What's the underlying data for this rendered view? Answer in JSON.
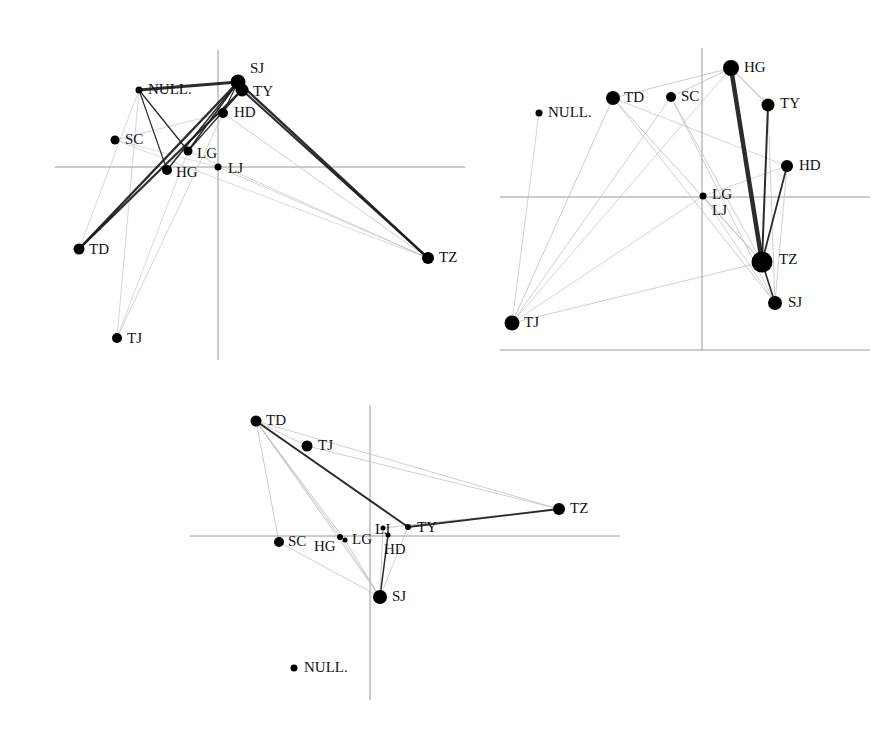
{
  "figure": {
    "title": "",
    "width": 893,
    "height": 729,
    "background": "#ffffff",
    "node_color": "#000000",
    "axis_color": "#9a9a9a",
    "edge_color_strong": "#1a1a1a",
    "edge_color_weak": "#b9b9b9",
    "panel_count": 3
  },
  "chart_data": {
    "type": "scatter",
    "title": "",
    "xlabel": "",
    "ylabel": "",
    "grid": false,
    "legend": "none",
    "labels": [
      "SJ",
      "TY",
      "HD",
      "LG",
      "LJ",
      "HG",
      "SC",
      "NULL.",
      "TD",
      "TJ",
      "TZ"
    ],
    "panels": [
      {
        "id": "panel-top-left",
        "name": "Panel 1",
        "origin": {
          "x": 218,
          "y": 167
        },
        "axes": {
          "horizontal": {
            "y": 167,
            "x1": 55,
            "x2": 465
          },
          "vertical": {
            "x": 218,
            "y1": 50,
            "y2": 360
          }
        },
        "nodes": [
          {
            "label": "SJ",
            "x": 238,
            "y": 82,
            "r": 7.5,
            "lx": 250,
            "ly": 70
          },
          {
            "label": "TY",
            "x": 242,
            "y": 90,
            "r": 6.5,
            "lx": 253,
            "ly": 93
          },
          {
            "label": "HD",
            "x": 223,
            "y": 113,
            "r": 5.0,
            "lx": 234,
            "ly": 114
          },
          {
            "label": "NULL.",
            "x": 139,
            "y": 90,
            "r": 3.5,
            "lx": 148,
            "ly": 91
          },
          {
            "label": "SC",
            "x": 115,
            "y": 140,
            "r": 4.5,
            "lx": 125,
            "ly": 141
          },
          {
            "label": "LG",
            "x": 188,
            "y": 151,
            "r": 4.5,
            "lx": 197,
            "ly": 155
          },
          {
            "label": "HG",
            "x": 167,
            "y": 170,
            "r": 5.0,
            "lx": 176,
            "ly": 174
          },
          {
            "label": "LJ",
            "x": 218,
            "y": 167,
            "r": 3.5,
            "lx": 228,
            "ly": 170
          },
          {
            "label": "TD",
            "x": 79,
            "y": 249,
            "r": 5.5,
            "lx": 89,
            "ly": 251
          },
          {
            "label": "TJ",
            "x": 117,
            "y": 338,
            "r": 5.0,
            "lx": 127,
            "ly": 340
          },
          {
            "label": "TZ",
            "x": 428,
            "y": 258,
            "r": 6.0,
            "lx": 439,
            "ly": 259
          }
        ],
        "edges": [
          {
            "from": "SJ",
            "to": "TY",
            "weight": 4.0,
            "tone": "strong"
          },
          {
            "from": "SJ",
            "to": "TD",
            "weight": 2.4,
            "tone": "strong"
          },
          {
            "from": "TY",
            "to": "TD",
            "weight": 2.2,
            "tone": "strong"
          },
          {
            "from": "SJ",
            "to": "TZ",
            "weight": 2.3,
            "tone": "strong"
          },
          {
            "from": "TY",
            "to": "TZ",
            "weight": 2.0,
            "tone": "strong"
          },
          {
            "from": "SJ",
            "to": "LG",
            "weight": 1.6,
            "tone": "strong"
          },
          {
            "from": "TY",
            "to": "LG",
            "weight": 1.3,
            "tone": "strong"
          },
          {
            "from": "SJ",
            "to": "HG",
            "weight": 1.5,
            "tone": "strong"
          },
          {
            "from": "SJ",
            "to": "NULL.",
            "weight": 3.0,
            "tone": "strong"
          },
          {
            "from": "NULL.",
            "to": "LG",
            "weight": 1.3,
            "tone": "strong"
          },
          {
            "from": "NULL.",
            "to": "HG",
            "weight": 1.2,
            "tone": "strong"
          },
          {
            "from": "SJ",
            "to": "HD",
            "weight": 1.1,
            "tone": "strong"
          },
          {
            "from": "HD",
            "to": "TZ",
            "weight": 0.9,
            "tone": "weak"
          },
          {
            "from": "HD",
            "to": "SC",
            "weight": 0.8,
            "tone": "weak"
          },
          {
            "from": "LG",
            "to": "TZ",
            "weight": 0.8,
            "tone": "weak"
          },
          {
            "from": "LJ",
            "to": "TZ",
            "weight": 0.8,
            "tone": "weak"
          },
          {
            "from": "NULL.",
            "to": "TJ",
            "weight": 0.8,
            "tone": "weak"
          },
          {
            "from": "SJ",
            "to": "TJ",
            "weight": 0.8,
            "tone": "weak"
          },
          {
            "from": "LG",
            "to": "TJ",
            "weight": 0.7,
            "tone": "weak"
          },
          {
            "from": "SC",
            "to": "TZ",
            "weight": 0.7,
            "tone": "weak"
          },
          {
            "from": "NULL.",
            "to": "TD",
            "weight": 0.7,
            "tone": "weak"
          },
          {
            "from": "SC",
            "to": "LJ",
            "weight": 0.7,
            "tone": "weak"
          }
        ]
      },
      {
        "id": "panel-top-right",
        "name": "Panel 2",
        "origin": {
          "x": 702,
          "y": 197
        },
        "axes": {
          "horizontal": {
            "y": 197,
            "x1": 500,
            "x2": 870
          },
          "vertical": {
            "x": 702,
            "y1": 48,
            "y2": 350
          },
          "baseline": {
            "y": 350,
            "x1": 500,
            "x2": 870
          }
        },
        "nodes": [
          {
            "label": "HG",
            "x": 731,
            "y": 68,
            "r": 8.0,
            "lx": 744,
            "ly": 69
          },
          {
            "label": "TD",
            "x": 613,
            "y": 98,
            "r": 7.0,
            "lx": 624,
            "ly": 99
          },
          {
            "label": "SC",
            "x": 671,
            "y": 97,
            "r": 5.0,
            "lx": 681,
            "ly": 98
          },
          {
            "label": "TY",
            "x": 768,
            "y": 105,
            "r": 6.5,
            "lx": 780,
            "ly": 105
          },
          {
            "label": "NULL.",
            "x": 539,
            "y": 113,
            "r": 3.5,
            "lx": 548,
            "ly": 114
          },
          {
            "label": "HD",
            "x": 787,
            "y": 166,
            "r": 6.0,
            "lx": 799,
            "ly": 167
          },
          {
            "label": "LG",
            "x": 703,
            "y": 196,
            "r": 3.5,
            "lx": 712,
            "ly": 196
          },
          {
            "label": "LJ",
            "x": 703,
            "y": 196,
            "r": 2.5,
            "lx": 712,
            "ly": 212
          },
          {
            "label": "TZ",
            "x": 762,
            "y": 262,
            "r": 10.5,
            "lx": 779,
            "ly": 261
          },
          {
            "label": "SJ",
            "x": 775,
            "y": 303,
            "r": 7.0,
            "lx": 788,
            "ly": 304
          },
          {
            "label": "TJ",
            "x": 512,
            "y": 323,
            "r": 7.5,
            "lx": 524,
            "ly": 324
          }
        ],
        "edges": [
          {
            "from": "HG",
            "to": "TZ",
            "weight": 4.5,
            "tone": "strong"
          },
          {
            "from": "TY",
            "to": "TZ",
            "weight": 2.0,
            "tone": "strong"
          },
          {
            "from": "HD",
            "to": "TZ",
            "weight": 1.8,
            "tone": "strong"
          },
          {
            "from": "TZ",
            "to": "SJ",
            "weight": 1.6,
            "tone": "strong"
          },
          {
            "from": "HG",
            "to": "TY",
            "weight": 1.3,
            "tone": "weak"
          },
          {
            "from": "HG",
            "to": "SC",
            "weight": 1.0,
            "tone": "weak"
          },
          {
            "from": "HG",
            "to": "TD",
            "weight": 1.0,
            "tone": "weak"
          },
          {
            "from": "TD",
            "to": "TZ",
            "weight": 1.0,
            "tone": "weak"
          },
          {
            "from": "TD",
            "to": "TJ",
            "weight": 1.0,
            "tone": "weak"
          },
          {
            "from": "TD",
            "to": "SJ",
            "weight": 0.9,
            "tone": "weak"
          },
          {
            "from": "SC",
            "to": "TJ",
            "weight": 0.9,
            "tone": "weak"
          },
          {
            "from": "SC",
            "to": "SJ",
            "weight": 0.9,
            "tone": "weak"
          },
          {
            "from": "SC",
            "to": "TZ",
            "weight": 0.9,
            "tone": "weak"
          },
          {
            "from": "TY",
            "to": "SJ",
            "weight": 0.9,
            "tone": "weak"
          },
          {
            "from": "HD",
            "to": "SJ",
            "weight": 0.9,
            "tone": "weak"
          },
          {
            "from": "HD",
            "to": "LG",
            "weight": 0.8,
            "tone": "weak"
          },
          {
            "from": "LG",
            "to": "TZ",
            "weight": 0.9,
            "tone": "weak"
          },
          {
            "from": "LG",
            "to": "SJ",
            "weight": 0.8,
            "tone": "weak"
          },
          {
            "from": "LG",
            "to": "TJ",
            "weight": 0.8,
            "tone": "weak"
          },
          {
            "from": "NULL.",
            "to": "TJ",
            "weight": 0.8,
            "tone": "weak"
          },
          {
            "from": "TJ",
            "to": "TZ",
            "weight": 0.9,
            "tone": "weak"
          },
          {
            "from": "TD",
            "to": "HD",
            "weight": 0.8,
            "tone": "weak"
          },
          {
            "from": "HG",
            "to": "TJ",
            "weight": 0.8,
            "tone": "weak"
          }
        ]
      },
      {
        "id": "panel-bottom",
        "name": "Panel 3",
        "origin": {
          "x": 370,
          "y": 536
        },
        "axes": {
          "horizontal": {
            "y": 536,
            "x1": 190,
            "x2": 620
          },
          "vertical": {
            "x": 370,
            "y1": 405,
            "y2": 700
          }
        },
        "nodes": [
          {
            "label": "TD",
            "x": 256,
            "y": 421,
            "r": 5.5,
            "lx": 266,
            "ly": 422
          },
          {
            "label": "TJ",
            "x": 307,
            "y": 446,
            "r": 5.5,
            "lx": 318,
            "ly": 447
          },
          {
            "label": "TZ",
            "x": 559,
            "y": 509,
            "r": 6.0,
            "lx": 570,
            "ly": 510
          },
          {
            "label": "SC",
            "x": 279,
            "y": 542,
            "r": 5.0,
            "lx": 288,
            "ly": 543
          },
          {
            "label": "HG",
            "x": 340,
            "y": 537,
            "r": 3.0,
            "lx": 314,
            "ly": 548
          },
          {
            "label": "LG",
            "x": 345,
            "y": 540,
            "r": 2.5,
            "lx": 352,
            "ly": 541
          },
          {
            "label": "LJ",
            "x": 383,
            "y": 528,
            "r": 2.5,
            "lx": 375,
            "ly": 531
          },
          {
            "label": "TY",
            "x": 408,
            "y": 527,
            "r": 3.0,
            "lx": 417,
            "ly": 529
          },
          {
            "label": "HD",
            "x": 388,
            "y": 535,
            "r": 2.5,
            "lx": 384,
            "ly": 551
          },
          {
            "label": "SJ",
            "x": 380,
            "y": 597,
            "r": 7.0,
            "lx": 392,
            "ly": 598
          },
          {
            "label": "NULL.",
            "x": 294,
            "y": 668,
            "r": 3.5,
            "lx": 304,
            "ly": 669
          }
        ],
        "edges": [
          {
            "from": "TD",
            "to": "TY",
            "weight": 2.0,
            "tone": "strong"
          },
          {
            "from": "TY",
            "to": "TZ",
            "weight": 1.8,
            "tone": "strong"
          },
          {
            "from": "LJ",
            "to": "TZ",
            "weight": 1.2,
            "tone": "weak"
          },
          {
            "from": "HD",
            "to": "SJ",
            "weight": 1.5,
            "tone": "strong"
          },
          {
            "from": "TD",
            "to": "SC",
            "weight": 1.0,
            "tone": "weak"
          },
          {
            "from": "TD",
            "to": "SJ",
            "weight": 1.0,
            "tone": "weak"
          },
          {
            "from": "TD",
            "to": "LG",
            "weight": 1.0,
            "tone": "weak"
          },
          {
            "from": "TD",
            "to": "HG",
            "weight": 1.0,
            "tone": "weak"
          },
          {
            "from": "TD",
            "to": "TJ",
            "weight": 0.9,
            "tone": "weak"
          },
          {
            "from": "TD",
            "to": "TZ",
            "weight": 0.9,
            "tone": "weak"
          },
          {
            "from": "TJ",
            "to": "TZ",
            "weight": 0.9,
            "tone": "weak"
          },
          {
            "from": "SC",
            "to": "SJ",
            "weight": 0.9,
            "tone": "weak"
          },
          {
            "from": "LG",
            "to": "SJ",
            "weight": 0.9,
            "tone": "weak"
          },
          {
            "from": "HG",
            "to": "SJ",
            "weight": 0.9,
            "tone": "weak"
          },
          {
            "from": "LJ",
            "to": "SJ",
            "weight": 0.9,
            "tone": "weak"
          },
          {
            "from": "TY",
            "to": "SJ",
            "weight": 0.9,
            "tone": "weak"
          }
        ]
      }
    ]
  }
}
